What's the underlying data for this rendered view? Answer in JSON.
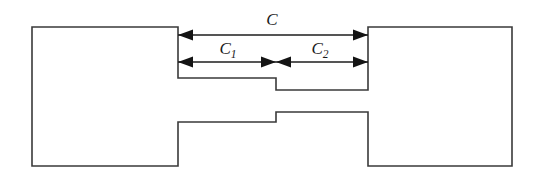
{
  "figure": {
    "type": "engineering-diagram",
    "background_color": "#ffffff",
    "outline_color": "#3a3a3a",
    "dimension_color": "#141414"
  },
  "dimensions": [
    {
      "id": "c-total",
      "label": "C",
      "subscript": "",
      "label_x": 272,
      "label_y": 25,
      "line_y": 35,
      "x_start": 178,
      "x_end": 368,
      "arrow_start": "left",
      "arrow_end": "right"
    },
    {
      "id": "c1",
      "label": "C",
      "subscript": "1",
      "label_x": 228,
      "label_y": 54,
      "line_y": 62,
      "x_start": 178,
      "x_end": 276,
      "arrow_start": "left",
      "arrow_end": "right"
    },
    {
      "id": "c2",
      "label": "C",
      "subscript": "2",
      "label_x": 320,
      "label_y": 54,
      "line_y": 62,
      "x_start": 276,
      "x_end": 368,
      "arrow_start": "left",
      "arrow_end": "right"
    }
  ],
  "geometry": {
    "outline_path": "M 32 27 L 178 27 L 178 78 L 276 78 L 276 90 L 368 90 L 368 27 L 512 27 L 512 166 L 368 166 L 368 112 L 276 112 L 276 122 L 178 122 L 178 166 L 32 166 Z",
    "left_block": {
      "x": 32,
      "y": 27,
      "width": 146,
      "height": 139
    },
    "right_block": {
      "x": 368,
      "y": 27,
      "width": 144,
      "height": 139
    },
    "step_x": 276,
    "upper_tongue_y": 78,
    "upper_step_y": 90,
    "lower_step_y": 112,
    "lower_tongue_y": 122
  }
}
